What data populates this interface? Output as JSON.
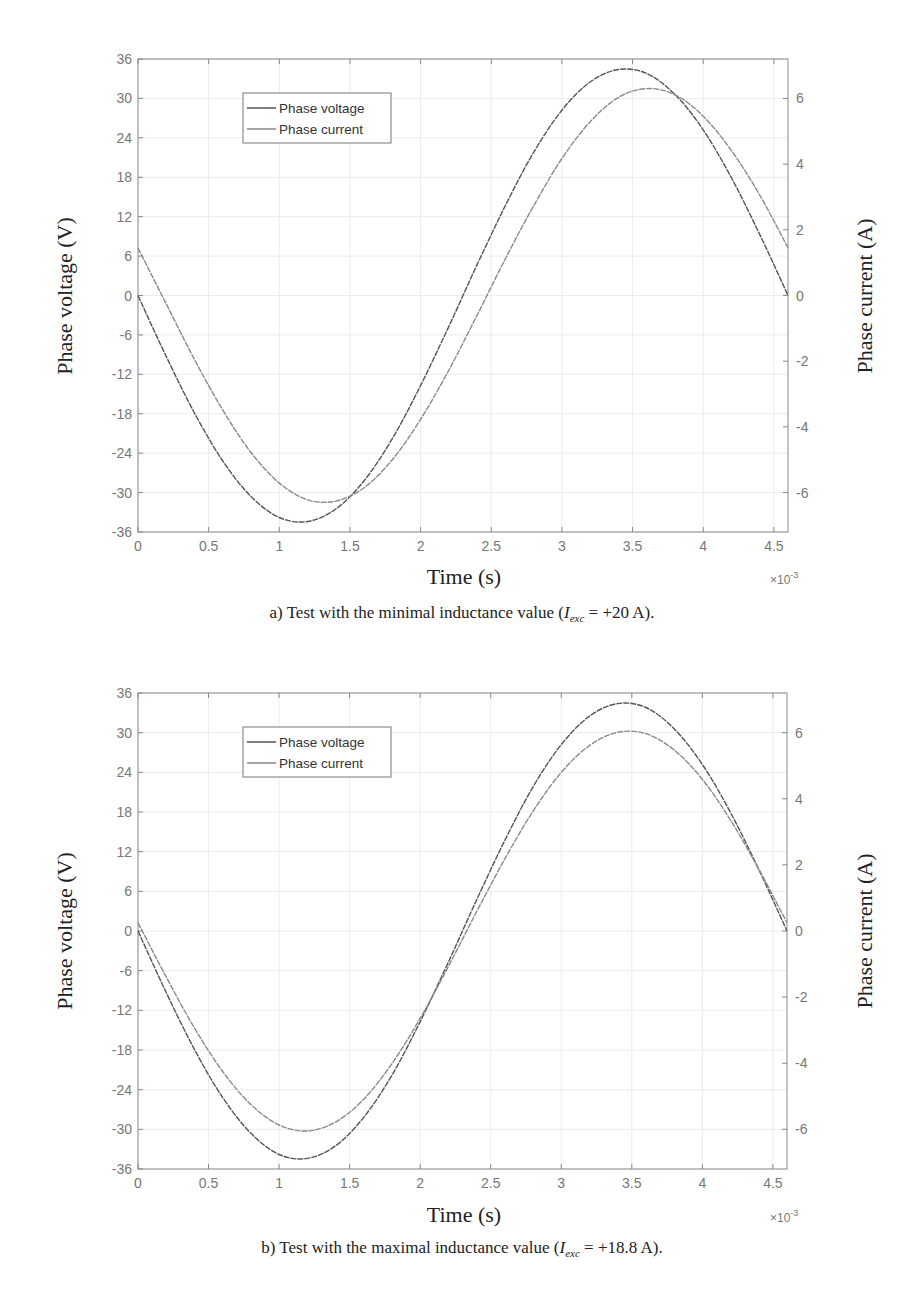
{
  "chart_data": [
    {
      "type": "line",
      "id": "a",
      "caption": "a) Test with the minimal inductance value (I_exc = +20 A).",
      "caption_parts": {
        "prefix": "a) Test with the minimal inductance value (",
        "var": "I",
        "sub": "exc",
        "suffix": " = +20 A)."
      },
      "xlabel": "Time (s)",
      "x_exponent": "×10",
      "x_exponent_power": "-3",
      "ylabel": "Phase voltage (V)",
      "ylabel_right": "Phase current (A)",
      "xlim": [
        0,
        4.6
      ],
      "ylim": [
        -36,
        36
      ],
      "ylim_right": [
        -7.2,
        7.2
      ],
      "xticks": [
        "0",
        "0.5",
        "1",
        "1.5",
        "2",
        "2.5",
        "3",
        "3.5",
        "4",
        "4.5"
      ],
      "yticks": [
        "36",
        "30",
        "24",
        "18",
        "12",
        "6",
        "0",
        "-6",
        "-12",
        "-18",
        "-24",
        "-30",
        "-36"
      ],
      "yticks_right": [
        "6",
        "4",
        "2",
        "0",
        "-2",
        "-4",
        "-6"
      ],
      "grid": true,
      "legend": {
        "position": "upper-left",
        "entries": [
          "Phase voltage",
          "Phase current"
        ]
      },
      "x": [
        0,
        0.2,
        0.4,
        0.6,
        0.8,
        1.0,
        1.2,
        1.4,
        1.6,
        1.8,
        2.0,
        2.2,
        2.4,
        2.6,
        2.8,
        3.0,
        3.2,
        3.4,
        3.6,
        3.8,
        4.0,
        4.2,
        4.4,
        4.6
      ],
      "series": [
        {
          "name": "Phase voltage",
          "axis": "left",
          "color": "#555555",
          "values": [
            0,
            -9.3,
            -17.9,
            -25.2,
            -30.6,
            -33.8,
            -34.4,
            -32.5,
            -28.2,
            -21.8,
            -13.7,
            -4.7,
            4.7,
            13.7,
            21.8,
            28.2,
            32.5,
            34.4,
            33.8,
            30.6,
            25.2,
            17.9,
            9.3,
            0
          ]
        },
        {
          "name": "Phase current",
          "axis": "right",
          "color": "#8a8a8a",
          "values": [
            1.45,
            -0.26,
            -1.95,
            -3.49,
            -4.78,
            -5.71,
            -6.22,
            -6.26,
            -5.85,
            -5.0,
            -3.77,
            -2.27,
            -0.6,
            1.12,
            2.73,
            4.17,
            5.29,
            6.03,
            6.3,
            6.11,
            5.46,
            4.41,
            3.06,
            1.45
          ]
        }
      ]
    },
    {
      "type": "line",
      "id": "b",
      "caption": "b) Test with the maximal inductance value (I_exc = +18.8 A).",
      "caption_parts": {
        "prefix": "b) Test with the maximal inductance value (",
        "var": "I",
        "sub": "exc",
        "suffix": " = +18.8 A)."
      },
      "xlabel": "Time (s)",
      "x_exponent": "×10",
      "x_exponent_power": "-3",
      "ylabel": "Phase voltage (V)",
      "ylabel_right": "Phase current (A)",
      "xlim": [
        0,
        4.6
      ],
      "ylim": [
        -36,
        36
      ],
      "ylim_right": [
        -7.2,
        7.2
      ],
      "xticks": [
        "0",
        "0.5",
        "1",
        "1.5",
        "2",
        "2.5",
        "3",
        "3.5",
        "4",
        "4.5"
      ],
      "yticks": [
        "36",
        "30",
        "24",
        "18",
        "12",
        "6",
        "0",
        "-6",
        "-12",
        "-18",
        "-24",
        "-30",
        "-36"
      ],
      "yticks_right": [
        "6",
        "4",
        "2",
        "0",
        "-2",
        "-4",
        "-6"
      ],
      "grid": true,
      "legend": {
        "position": "upper-left",
        "entries": [
          "Phase voltage",
          "Phase current"
        ]
      },
      "x": [
        0,
        0.2,
        0.4,
        0.6,
        0.8,
        1.0,
        1.2,
        1.4,
        1.6,
        1.8,
        2.0,
        2.2,
        2.4,
        2.6,
        2.8,
        3.0,
        3.2,
        3.4,
        3.6,
        3.8,
        4.0,
        4.2,
        4.4,
        4.6
      ],
      "series": [
        {
          "name": "Phase voltage",
          "axis": "left",
          "color": "#555555",
          "values": [
            0,
            -9.3,
            -17.9,
            -25.2,
            -30.6,
            -33.8,
            -34.4,
            -32.5,
            -28.2,
            -21.8,
            -13.7,
            -4.7,
            4.7,
            13.7,
            21.8,
            28.2,
            32.5,
            34.4,
            33.8,
            30.6,
            25.2,
            17.9,
            9.3,
            0
          ]
        },
        {
          "name": "Phase current",
          "axis": "right",
          "color": "#8a8a8a",
          "values": [
            0.25,
            -1.39,
            -2.93,
            -4.25,
            -5.25,
            -5.87,
            -6.05,
            -5.78,
            -5.09,
            -4.01,
            -2.64,
            -1.07,
            0.58,
            2.18,
            3.62,
            4.8,
            5.61,
            6.01,
            5.97,
            5.48,
            4.59,
            3.35,
            1.87,
            0.25
          ]
        }
      ]
    }
  ]
}
